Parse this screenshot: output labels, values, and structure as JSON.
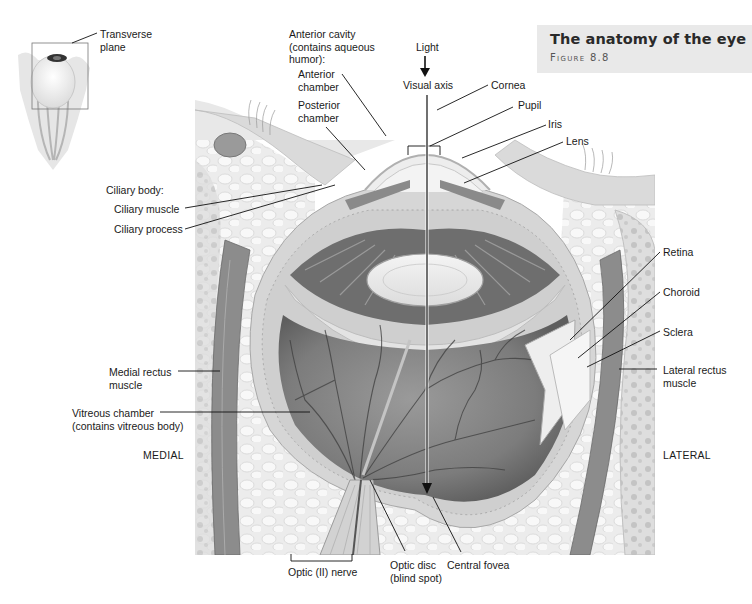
{
  "title_box": {
    "title": "The anatomy of the eye",
    "subtitle": "Figure 8.8"
  },
  "inset": {
    "label": [
      "Transverse",
      "plane"
    ]
  },
  "labels": {
    "anterior_cavity": [
      "Anterior cavity",
      "(contains aqueous",
      "humor):"
    ],
    "anterior_chamber": [
      "Anterior",
      "chamber"
    ],
    "posterior_chamber": [
      "Posterior",
      "chamber"
    ],
    "light": "Light",
    "visual_axis": "Visual axis",
    "cornea": "Cornea",
    "pupil": "Pupil",
    "iris": "Iris",
    "lens": "Lens",
    "ciliary_body": "Ciliary body:",
    "ciliary_muscle": "Ciliary muscle",
    "ciliary_process": "Ciliary process",
    "retina": "Retina",
    "choroid": "Choroid",
    "sclera": "Sclera",
    "medial_rectus": [
      "Medial rectus",
      "muscle"
    ],
    "lateral_rectus": [
      "Lateral rectus",
      "muscle"
    ],
    "vitreous_chamber": [
      "Vitreous chamber",
      "(contains vitreous body)"
    ],
    "medial": "MEDIAL",
    "lateral": "LATERAL",
    "optic_nerve": "Optic (II) nerve",
    "optic_disc": [
      "Optic disc",
      "(blind spot)"
    ],
    "central_fovea": "Central fovea"
  },
  "colors": {
    "title_bg": "#e9e9e9",
    "vitreous": "#7a7a7a",
    "tissue": "#d8d8d8",
    "fat": "#efefef",
    "label_text": "#1a1a1a"
  }
}
